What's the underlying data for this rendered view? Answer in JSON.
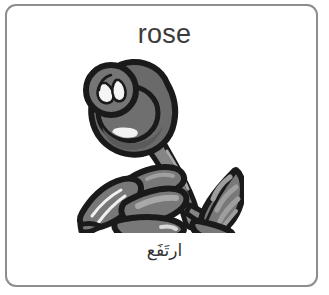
{
  "card": {
    "word_en": "rose",
    "word_ar": "ارتَفَع",
    "border_color": "#8d8d8d",
    "background_color": "#ffffff",
    "text_color_en": "#3b3b3b",
    "text_color_ar": "#323232"
  },
  "illustration": {
    "name": "rose-flower-line-art",
    "description": "grayscale clip-art rose with bud, stem and two leaf clusters",
    "outline_color": "#1a1a1a",
    "bud_fill": "#6a6a6a",
    "bud_shade": "#595959",
    "leaf_fill": "#787878",
    "leaf_highlight": "#9a9a9a",
    "stem_fill": "#858585",
    "highlight_color": "#f2f2f2"
  }
}
